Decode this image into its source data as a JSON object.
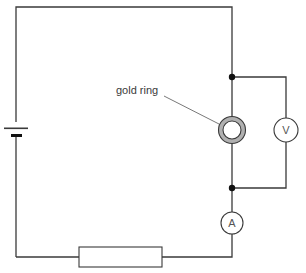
{
  "diagram": {
    "type": "circuit",
    "labels": {
      "gold_ring": "gold ring",
      "voltmeter": "V",
      "ammeter": "A"
    },
    "components": [
      {
        "id": "cell",
        "kind": "battery"
      },
      {
        "id": "resistor",
        "kind": "resistor"
      },
      {
        "id": "ammeter",
        "kind": "meter",
        "symbol": "A"
      },
      {
        "id": "gold_ring",
        "kind": "test-component",
        "label": "gold ring"
      },
      {
        "id": "voltmeter",
        "kind": "meter",
        "symbol": "V",
        "connection": "parallel with gold ring"
      }
    ],
    "colors": {
      "wire": "#3a3a3a",
      "ring_fill": "#aaaaaa",
      "background": "#ffffff"
    }
  }
}
